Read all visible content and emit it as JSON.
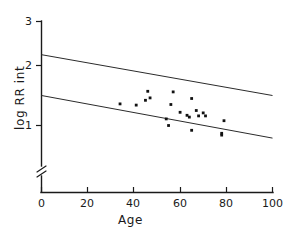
{
  "chart_data": {
    "type": "scatter",
    "title": "",
    "xlabel": "Age",
    "ylabel": "log RR int",
    "xlim": [
      0,
      100
    ],
    "ylim": [
      0.7,
      3
    ],
    "grid": false,
    "legend": null,
    "xticks": [
      "0",
      "20",
      "40",
      "60",
      "80",
      "100"
    ],
    "xtick_values": [
      0,
      20,
      40,
      60,
      80,
      100
    ],
    "yticks": [
      "1",
      "2",
      "3"
    ],
    "ytick_values": [
      1,
      2,
      3
    ],
    "y_axis_break": true,
    "y_axis_break_symbol": "//",
    "points": [
      {
        "x": 34,
        "y": 1.36
      },
      {
        "x": 41,
        "y": 1.34
      },
      {
        "x": 45,
        "y": 1.42
      },
      {
        "x": 46,
        "y": 1.57
      },
      {
        "x": 47,
        "y": 1.46
      },
      {
        "x": 54,
        "y": 1.11
      },
      {
        "x": 55,
        "y": 1.0
      },
      {
        "x": 56,
        "y": 1.35
      },
      {
        "x": 57,
        "y": 1.56
      },
      {
        "x": 60,
        "y": 1.22
      },
      {
        "x": 63,
        "y": 1.17
      },
      {
        "x": 64,
        "y": 1.14
      },
      {
        "x": 65,
        "y": 0.92
      },
      {
        "x": 65,
        "y": 1.45
      },
      {
        "x": 67,
        "y": 1.25
      },
      {
        "x": 68,
        "y": 1.16
      },
      {
        "x": 70,
        "y": 1.21
      },
      {
        "x": 71,
        "y": 1.16
      },
      {
        "x": 78,
        "y": 0.87
      },
      {
        "x": 78,
        "y": 0.84
      },
      {
        "x": 79,
        "y": 1.08
      }
    ],
    "lines": [
      {
        "name": "upper-bound-line",
        "x": [
          0,
          100
        ],
        "y": [
          2.18,
          1.5
        ]
      },
      {
        "name": "lower-bound-line",
        "x": [
          0,
          100
        ],
        "y": [
          1.5,
          0.79
        ]
      }
    ]
  },
  "colors": {
    "axis": "#1a1a1a",
    "point": "#111111",
    "line": "#2b2b2b",
    "background": "#ffffff"
  }
}
